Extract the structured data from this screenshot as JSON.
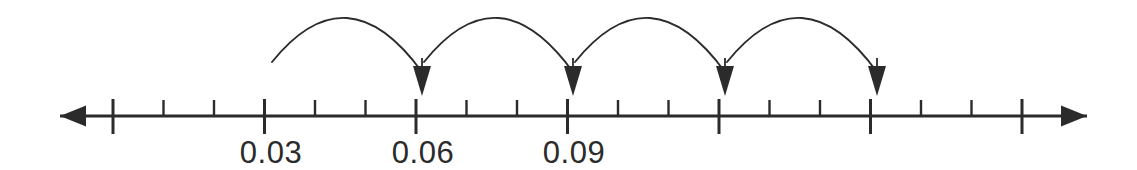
{
  "figure": {
    "background_color": "#ffffff",
    "ink_color": "#2b2b2b",
    "width": 1137,
    "height": 170
  },
  "number_line": {
    "axis_y": 116,
    "left_arrow_tip_x": 60,
    "right_arrow_tip_x": 1087,
    "line_start_x": 60,
    "line_end_x": 1087,
    "line_width": 3.2,
    "major_tick_start_x": 113,
    "major_tick_spacing": 151.5,
    "major_tick_count": 7,
    "minor_ticks_between_majors": 2,
    "major_tick_top_y": 99,
    "major_tick_bottom_y": 134,
    "minor_tick_top_y": 100,
    "minor_tick_bottom_y": 117,
    "major_tick_width": 3.0,
    "minor_tick_width": 2.4,
    "left_arrow_label": "arrow-left",
    "right_arrow_label": "arrow-right"
  },
  "tick_labels": [
    {
      "text": "0.03",
      "x": 271,
      "y": 163
    },
    {
      "text": "0.06",
      "x": 423,
      "y": 163
    },
    {
      "text": "0.09",
      "x": 574,
      "y": 163
    }
  ],
  "hops": [
    {
      "name": "hop-1",
      "from_x": 272,
      "to_x": 422,
      "apex_y": 9,
      "start_y": 62
    },
    {
      "name": "hop-2",
      "from_x": 424,
      "to_x": 573,
      "apex_y": 9,
      "start_y": 62
    },
    {
      "name": "hop-3",
      "from_x": 575,
      "to_x": 725,
      "apex_y": 9,
      "start_y": 62
    },
    {
      "name": "hop-4",
      "from_x": 727,
      "to_x": 877,
      "apex_y": 9,
      "start_y": 62
    }
  ],
  "arrowheads": [
    {
      "name": "hop-arrowhead-1",
      "x": 422,
      "tip_y": 96,
      "top_y": 66,
      "half_width": 9
    },
    {
      "name": "hop-arrowhead-2",
      "x": 573,
      "tip_y": 96,
      "top_y": 66,
      "half_width": 9
    },
    {
      "name": "hop-arrowhead-3",
      "x": 725,
      "tip_y": 96,
      "top_y": 66,
      "half_width": 9
    },
    {
      "name": "hop-arrowhead-4",
      "x": 877,
      "tip_y": 96,
      "top_y": 66,
      "half_width": 9
    }
  ],
  "chart_data": {
    "type": "line",
    "xlabel": "",
    "ylabel": "",
    "labeled_values": [
      "0.03",
      "0.06",
      "0.09"
    ],
    "step": 0.03,
    "hop_sequence": [
      "0.03 to 0.06",
      "0.06 to 0.09",
      "0.09 to 0.12",
      "0.12 to 0.15"
    ],
    "tick_interval": 0.01,
    "major_tick_interval": 0.03,
    "grid": false
  }
}
